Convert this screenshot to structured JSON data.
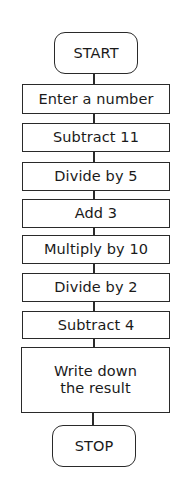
{
  "flowchart": {
    "start": {
      "label": "START"
    },
    "steps": [
      {
        "label": "Enter a number"
      },
      {
        "label": "Subtract 11"
      },
      {
        "label": "Divide by 5"
      },
      {
        "label": "Add 3"
      },
      {
        "label": "Multiply by 10"
      },
      {
        "label": "Divide by 2"
      },
      {
        "label": "Subtract 4"
      },
      {
        "label": "Write down the result"
      }
    ],
    "stop": {
      "label": "STOP"
    }
  }
}
